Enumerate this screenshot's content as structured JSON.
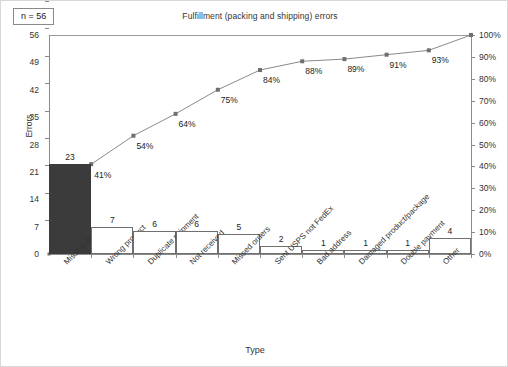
{
  "annotation": {
    "sample_size_label": "n = 56"
  },
  "axis_titles": {
    "x": "Type",
    "y_left": "Errors"
  },
  "chart_data": {
    "type": "bar",
    "title": "Fulfillment (packing and shipping) errors",
    "xlabel": "Type",
    "ylabel": "Errors",
    "ylim": [
      0,
      56
    ],
    "y2lim": [
      0,
      100
    ],
    "y2label": "",
    "grid": false,
    "legend": null,
    "total_n": 56,
    "categories": [
      "Missing items",
      "Wrong product",
      "Duplicate shipment",
      "Not received",
      "Missed orders",
      "Sent USPS not FedEx",
      "Bad address",
      "Damaged product/package",
      "Double payment",
      "Other"
    ],
    "values": [
      23,
      7,
      6,
      6,
      5,
      2,
      1,
      1,
      1,
      4
    ],
    "value_labels": [
      "23",
      "7",
      "6",
      "6",
      "5",
      "2",
      "1",
      "1",
      "1",
      "4"
    ],
    "cumulative_percent": [
      41,
      54,
      64,
      75,
      84,
      88,
      89,
      91,
      93,
      100
    ],
    "cumulative_percent_labels": [
      "41%",
      "54%",
      "64%",
      "75%",
      "84%",
      "88%",
      "89%",
      "91%",
      "93%",
      "100%"
    ],
    "yticks_left": [
      0,
      7,
      14,
      21,
      28,
      35,
      42,
      49,
      56
    ],
    "ytick_labels_left": [
      "0",
      "7",
      "14",
      "21",
      "28",
      "35",
      "42",
      "49",
      "56"
    ],
    "yticks_right": [
      0,
      10,
      20,
      30,
      40,
      50,
      60,
      70,
      80,
      90,
      100
    ],
    "ytick_labels_right": [
      "0%",
      "10%",
      "20%",
      "30%",
      "40%",
      "50%",
      "60%",
      "70%",
      "80%",
      "90%",
      "100%"
    ],
    "series": [
      {
        "name": "Errors",
        "type": "bar",
        "values": [
          23,
          7,
          6,
          6,
          5,
          2,
          1,
          1,
          1,
          4
        ]
      },
      {
        "name": "Cumulative %",
        "type": "line",
        "values": [
          41,
          54,
          64,
          75,
          84,
          88,
          89,
          91,
          93,
          100
        ]
      }
    ],
    "colors": {
      "first_bar_fill": "#3b3b3b",
      "bar_fill": "#ffffff",
      "bar_stroke": "#6f6f6f",
      "line": "#8a8a8a",
      "marker": "#6f6f6f"
    }
  }
}
